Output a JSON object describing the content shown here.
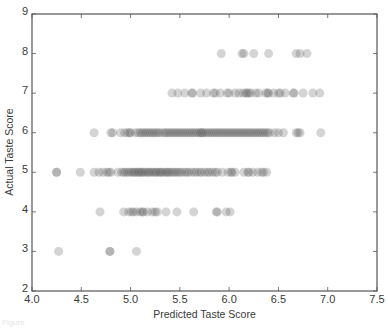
{
  "chart_data": {
    "type": "scatter",
    "title": "",
    "xlabel": "Predicted Taste Score",
    "ylabel": "Actual Taste Score",
    "xlim": [
      4.0,
      7.5
    ],
    "ylim": [
      2,
      9
    ],
    "xticks": [
      "4.0",
      "4.5",
      "5.0",
      "5.5",
      "6.0",
      "6.5",
      "7.0",
      "7.5"
    ],
    "yticks": [
      "2",
      "3",
      "4",
      "5",
      "6",
      "7",
      "8",
      "9"
    ],
    "grid": false,
    "legend": null,
    "marker": {
      "shape": "circle",
      "color": "#555555",
      "alpha": 0.25,
      "radius": 4.5
    },
    "series": [
      {
        "name": "wines",
        "points": [
          [
            4.27,
            3
          ],
          [
            4.79,
            3
          ],
          [
            4.79,
            3
          ],
          [
            5.06,
            3
          ],
          [
            4.69,
            4
          ],
          [
            4.93,
            4
          ],
          [
            4.98,
            4
          ],
          [
            5.01,
            4
          ],
          [
            5.03,
            4
          ],
          [
            5.06,
            4
          ],
          [
            5.1,
            4
          ],
          [
            5.12,
            4
          ],
          [
            5.13,
            4
          ],
          [
            5.17,
            4
          ],
          [
            5.22,
            4
          ],
          [
            5.25,
            4
          ],
          [
            5.27,
            4
          ],
          [
            5.36,
            4
          ],
          [
            5.47,
            4
          ],
          [
            5.64,
            4
          ],
          [
            5.87,
            4
          ],
          [
            5.88,
            4
          ],
          [
            5.97,
            4
          ],
          [
            6.01,
            4
          ],
          [
            4.25,
            5
          ],
          [
            4.25,
            5
          ],
          [
            4.49,
            5
          ],
          [
            4.63,
            5
          ],
          [
            4.68,
            5
          ],
          [
            4.72,
            5
          ],
          [
            4.76,
            5
          ],
          [
            4.78,
            5
          ],
          [
            4.8,
            5
          ],
          [
            4.87,
            5
          ],
          [
            4.91,
            5
          ],
          [
            4.93,
            5
          ],
          [
            4.95,
            5
          ],
          [
            4.97,
            5
          ],
          [
            4.99,
            5
          ],
          [
            5.01,
            5
          ],
          [
            5.03,
            5
          ],
          [
            5.04,
            5
          ],
          [
            5.06,
            5
          ],
          [
            5.08,
            5
          ],
          [
            5.09,
            5
          ],
          [
            5.11,
            5
          ],
          [
            5.12,
            5
          ],
          [
            5.14,
            5
          ],
          [
            5.16,
            5
          ],
          [
            5.18,
            5
          ],
          [
            5.19,
            5
          ],
          [
            5.21,
            5
          ],
          [
            5.23,
            5
          ],
          [
            5.25,
            5
          ],
          [
            5.26,
            5
          ],
          [
            5.28,
            5
          ],
          [
            5.3,
            5
          ],
          [
            5.31,
            5
          ],
          [
            5.33,
            5
          ],
          [
            5.35,
            5
          ],
          [
            5.37,
            5
          ],
          [
            5.38,
            5
          ],
          [
            5.4,
            5
          ],
          [
            5.42,
            5
          ],
          [
            5.44,
            5
          ],
          [
            5.46,
            5
          ],
          [
            5.48,
            5
          ],
          [
            5.5,
            5
          ],
          [
            5.52,
            5
          ],
          [
            5.55,
            5
          ],
          [
            5.57,
            5
          ],
          [
            5.59,
            5
          ],
          [
            5.62,
            5
          ],
          [
            5.65,
            5
          ],
          [
            5.67,
            5
          ],
          [
            5.7,
            5
          ],
          [
            5.72,
            5
          ],
          [
            5.75,
            5
          ],
          [
            5.78,
            5
          ],
          [
            5.8,
            5
          ],
          [
            5.83,
            5
          ],
          [
            5.86,
            5
          ],
          [
            5.88,
            5
          ],
          [
            5.93,
            5
          ],
          [
            5.99,
            5
          ],
          [
            6.02,
            5
          ],
          [
            6.03,
            5
          ],
          [
            6.06,
            5
          ],
          [
            6.15,
            5
          ],
          [
            6.19,
            5
          ],
          [
            6.2,
            5
          ],
          [
            6.24,
            5
          ],
          [
            6.29,
            5
          ],
          [
            6.33,
            5
          ],
          [
            6.35,
            5
          ],
          [
            6.38,
            5
          ],
          [
            4.63,
            6
          ],
          [
            4.8,
            6
          ],
          [
            4.82,
            6
          ],
          [
            4.9,
            6
          ],
          [
            4.94,
            6
          ],
          [
            4.97,
            6
          ],
          [
            4.99,
            6
          ],
          [
            5.0,
            6
          ],
          [
            5.05,
            6
          ],
          [
            5.08,
            6
          ],
          [
            5.1,
            6
          ],
          [
            5.12,
            6
          ],
          [
            5.14,
            6
          ],
          [
            5.16,
            6
          ],
          [
            5.18,
            6
          ],
          [
            5.2,
            6
          ],
          [
            5.22,
            6
          ],
          [
            5.24,
            6
          ],
          [
            5.26,
            6
          ],
          [
            5.28,
            6
          ],
          [
            5.3,
            6
          ],
          [
            5.33,
            6
          ],
          [
            5.35,
            6
          ],
          [
            5.37,
            6
          ],
          [
            5.39,
            6
          ],
          [
            5.41,
            6
          ],
          [
            5.43,
            6
          ],
          [
            5.45,
            6
          ],
          [
            5.47,
            6
          ],
          [
            5.49,
            6
          ],
          [
            5.51,
            6
          ],
          [
            5.53,
            6
          ],
          [
            5.55,
            6
          ],
          [
            5.57,
            6
          ],
          [
            5.59,
            6
          ],
          [
            5.61,
            6
          ],
          [
            5.63,
            6
          ],
          [
            5.65,
            6
          ],
          [
            5.67,
            6
          ],
          [
            5.69,
            6
          ],
          [
            5.71,
            6
          ],
          [
            5.72,
            6
          ],
          [
            5.73,
            6
          ],
          [
            5.75,
            6
          ],
          [
            5.77,
            6
          ],
          [
            5.79,
            6
          ],
          [
            5.81,
            6
          ],
          [
            5.83,
            6
          ],
          [
            5.85,
            6
          ],
          [
            5.87,
            6
          ],
          [
            5.89,
            6
          ],
          [
            5.91,
            6
          ],
          [
            5.93,
            6
          ],
          [
            5.95,
            6
          ],
          [
            5.97,
            6
          ],
          [
            5.99,
            6
          ],
          [
            6.01,
            6
          ],
          [
            6.03,
            6
          ],
          [
            6.05,
            6
          ],
          [
            6.07,
            6
          ],
          [
            6.09,
            6
          ],
          [
            6.11,
            6
          ],
          [
            6.13,
            6
          ],
          [
            6.15,
            6
          ],
          [
            6.17,
            6
          ],
          [
            6.19,
            6
          ],
          [
            6.21,
            6
          ],
          [
            6.23,
            6
          ],
          [
            6.25,
            6
          ],
          [
            6.27,
            6
          ],
          [
            6.29,
            6
          ],
          [
            6.31,
            6
          ],
          [
            6.33,
            6
          ],
          [
            6.35,
            6
          ],
          [
            6.37,
            6
          ],
          [
            6.39,
            6
          ],
          [
            6.41,
            6
          ],
          [
            6.46,
            6
          ],
          [
            6.5,
            6
          ],
          [
            6.55,
            6
          ],
          [
            6.68,
            6
          ],
          [
            6.7,
            6
          ],
          [
            6.72,
            6
          ],
          [
            6.93,
            6
          ],
          [
            5.42,
            7
          ],
          [
            5.48,
            7
          ],
          [
            5.55,
            7
          ],
          [
            5.62,
            7
          ],
          [
            5.63,
            7
          ],
          [
            5.71,
            7
          ],
          [
            5.77,
            7
          ],
          [
            5.84,
            7
          ],
          [
            5.86,
            7
          ],
          [
            5.91,
            7
          ],
          [
            5.98,
            7
          ],
          [
            6.0,
            7
          ],
          [
            6.06,
            7
          ],
          [
            6.1,
            7
          ],
          [
            6.14,
            7
          ],
          [
            6.17,
            7
          ],
          [
            6.18,
            7
          ],
          [
            6.2,
            7
          ],
          [
            6.22,
            7
          ],
          [
            6.27,
            7
          ],
          [
            6.3,
            7
          ],
          [
            6.37,
            7
          ],
          [
            6.39,
            7
          ],
          [
            6.4,
            7
          ],
          [
            6.45,
            7
          ],
          [
            6.5,
            7
          ],
          [
            6.52,
            7
          ],
          [
            6.57,
            7
          ],
          [
            6.65,
            7
          ],
          [
            6.66,
            7
          ],
          [
            6.75,
            7
          ],
          [
            6.85,
            7
          ],
          [
            6.92,
            7
          ],
          [
            5.92,
            8
          ],
          [
            6.13,
            8
          ],
          [
            6.15,
            8
          ],
          [
            6.25,
            8
          ],
          [
            6.4,
            8
          ],
          [
            6.68,
            8
          ],
          [
            6.72,
            8
          ],
          [
            6.79,
            8
          ]
        ]
      }
    ]
  },
  "figure": {
    "caption": "Figure"
  }
}
